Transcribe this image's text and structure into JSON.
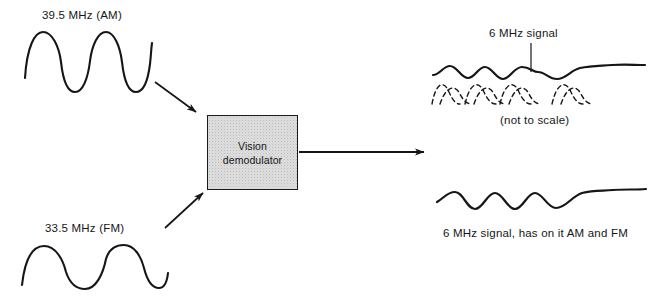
{
  "diagram": {
    "background_color": "#ffffff",
    "ink_color": "#15161a",
    "box_fill_color": "#dddddd",
    "labels": {
      "input_am": "39.5 MHz (AM)",
      "input_fm": "33.5 MHz (FM)",
      "block_line1": "Vision",
      "block_line2": "demodulator",
      "output_callout": "6 MHz signal",
      "output_note": "(not to scale)",
      "output_caption": "6 MHz signal, has on it AM and FM"
    },
    "waveforms": {
      "input_am": {
        "name": "39.5 MHz AM carrier",
        "style": "solid",
        "cycles": 3.5,
        "frequency_mhz": 39.5,
        "modulation": "AM"
      },
      "input_fm": {
        "name": "33.5 MHz FM carrier",
        "style": "solid",
        "cycles": 2.2,
        "frequency_mhz": 33.5,
        "modulation": "FM"
      },
      "output_top_solid": {
        "name": "6 MHz beat signal envelope",
        "style": "solid",
        "cycles": 4,
        "frequency_mhz": 6
      },
      "output_top_dashed": {
        "name": "underlying dashed arcs",
        "style": "dashed",
        "arc_groups": 4
      },
      "output_bottom": {
        "name": "6 MHz signal with AM and FM",
        "style": "solid",
        "cycles": 4,
        "frequency_mhz": 6
      }
    },
    "arrows": {
      "am_to_block": "arrow pointing down-right into demodulator",
      "fm_to_block": "arrow pointing up-right into demodulator",
      "block_to_output": "arrow pointing right out of demodulator"
    }
  }
}
